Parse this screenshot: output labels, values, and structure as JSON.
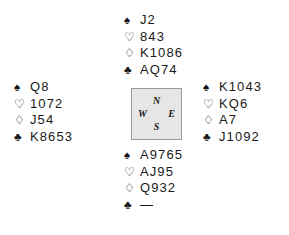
{
  "diagram": {
    "type": "bridge-deal-diagram",
    "suit_symbols": {
      "spade": "♠",
      "heart": "♡",
      "diamond": "♢",
      "club": "♣"
    },
    "void_marker": "—",
    "compass": {
      "north": "N",
      "west": "W",
      "east": "E",
      "south": "S",
      "box_fill": "#e6e6e4",
      "box_border": "#9a9a98"
    },
    "hands": {
      "north": {
        "position": "North",
        "spades": "J2",
        "hearts": "843",
        "diamonds": "K1086",
        "clubs": "AQ74"
      },
      "west": {
        "position": "West",
        "spades": "Q8",
        "hearts": "1072",
        "diamonds": "J54",
        "clubs": "K8653"
      },
      "east": {
        "position": "East",
        "spades": "K1043",
        "hearts": "KQ6",
        "diamonds": "A7",
        "clubs": "J1092"
      },
      "south": {
        "position": "South",
        "spades": "A9765",
        "hearts": "AJ95",
        "diamonds": "Q932",
        "clubs": "—"
      }
    }
  }
}
